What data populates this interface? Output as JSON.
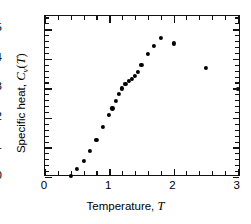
{
  "chart_data": {
    "type": "scatter",
    "title": "",
    "xlabel": "Temperature, T",
    "ylabel": "Specific heat, Cv(T)",
    "ylabel_parts": {
      "prefix": "Specific heat, ",
      "symbol": "C",
      "subscript": "v",
      "argument": "(T)"
    },
    "xlabel_parts": {
      "prefix": "Temperature, ",
      "symbol": "T"
    },
    "xlim": [
      0,
      3.05
    ],
    "ylim": [
      0,
      0.545
    ],
    "xticks": [
      0,
      1,
      2,
      3
    ],
    "xtick_labels": [
      "0",
      "1",
      "2",
      "3"
    ],
    "xminor_step": 0.2,
    "yticks": [
      0,
      0.1,
      0.2,
      0.3,
      0.4,
      0.5
    ],
    "ytick_labels": [
      "0",
      "0.1",
      "0.2",
      "0.3",
      "0.4",
      "0.5"
    ],
    "yminor_step": 0.02,
    "grid": false,
    "legend": null,
    "marker": "filled-circle",
    "marker_color": "#000000",
    "frame_color": "#111111",
    "background": "#ffffff",
    "x": [
      0.4,
      0.5,
      0.6,
      0.7,
      0.8,
      0.9,
      1.0,
      1.05,
      1.1,
      1.15,
      1.2,
      1.25,
      1.3,
      1.35,
      1.4,
      1.45,
      1.5,
      1.6,
      1.7,
      1.8,
      2.0,
      2.5,
      3.0
    ],
    "y": [
      0.003,
      0.028,
      0.055,
      0.088,
      0.125,
      0.17,
      0.21,
      0.232,
      0.257,
      0.281,
      0.3,
      0.316,
      0.325,
      0.333,
      0.343,
      0.355,
      0.38,
      0.418,
      0.443,
      0.472,
      0.452,
      0.37,
      0.299
    ],
    "n_points": 23
  }
}
